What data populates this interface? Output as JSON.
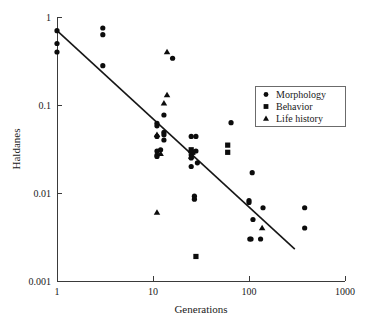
{
  "chart_data": {
    "type": "scatter",
    "title": "",
    "xlabel": "Generations",
    "ylabel": "Haldanes",
    "xscale": "log",
    "yscale": "log",
    "xlim": [
      1,
      1000
    ],
    "ylim": [
      0.001,
      1
    ],
    "xticks": [
      1,
      10,
      100,
      1000
    ],
    "xtick_labels": [
      "1",
      "10",
      "100",
      "1000"
    ],
    "yticks": [
      1,
      0.1,
      0.01,
      0.001
    ],
    "ytick_labels": [
      "1",
      "0.1",
      "0.01",
      "0.001"
    ],
    "grid": false,
    "legend_position": "right",
    "legend": [
      {
        "name": "Morphology",
        "marker": "circle"
      },
      {
        "name": "Behavior",
        "marker": "square"
      },
      {
        "name": "Life history",
        "marker": "triangle"
      }
    ],
    "series": [
      {
        "name": "Morphology",
        "marker": "circle",
        "points": [
          [
            1,
            0.7
          ],
          [
            1,
            0.5
          ],
          [
            1,
            0.4
          ],
          [
            3,
            0.75
          ],
          [
            3,
            0.63
          ],
          [
            3,
            0.28
          ],
          [
            11,
            0.062
          ],
          [
            11,
            0.058
          ],
          [
            11,
            0.044
          ],
          [
            11,
            0.03
          ],
          [
            11,
            0.027
          ],
          [
            11,
            0.026
          ],
          [
            12,
            0.031
          ],
          [
            13,
            0.077
          ],
          [
            13,
            0.049
          ],
          [
            13,
            0.046
          ],
          [
            13,
            0.04
          ],
          [
            16,
            0.34
          ],
          [
            25,
            0.044
          ],
          [
            25,
            0.03
          ],
          [
            25,
            0.027
          ],
          [
            25,
            0.025
          ],
          [
            25,
            0.02
          ],
          [
            28,
            0.044
          ],
          [
            28,
            0.03
          ],
          [
            29,
            0.022
          ],
          [
            27,
            0.0092
          ],
          [
            27,
            0.0085
          ],
          [
            65,
            0.063
          ],
          [
            100,
            0.0082
          ],
          [
            100,
            0.0078
          ],
          [
            102,
            0.003
          ],
          [
            105,
            0.003
          ],
          [
            108,
            0.017
          ],
          [
            110,
            0.005
          ],
          [
            132,
            0.003
          ],
          [
            140,
            0.0068
          ],
          [
            380,
            0.0068
          ],
          [
            380,
            0.004
          ]
        ]
      },
      {
        "name": "Behavior",
        "marker": "square",
        "points": [
          [
            25,
            0.031
          ],
          [
            26,
            0.029
          ],
          [
            60,
            0.035
          ],
          [
            60,
            0.029
          ],
          [
            28,
            0.0019
          ]
        ]
      },
      {
        "name": "Life history",
        "marker": "triangle",
        "points": [
          [
            14,
            0.4
          ],
          [
            14,
            0.13
          ],
          [
            13,
            0.105
          ],
          [
            11,
            0.046
          ],
          [
            12,
            0.028
          ],
          [
            25,
            0.03
          ],
          [
            25,
            0.026
          ],
          [
            11,
            0.006
          ],
          [
            137,
            0.004
          ]
        ]
      }
    ],
    "fit_line": {
      "label": "regression",
      "x_start": 1,
      "y_start": 0.7,
      "x_end": 300,
      "y_end": 0.0023
    }
  },
  "axes_geometry": {
    "left_px": 57,
    "right_px": 345,
    "top_px": 17,
    "bottom_px": 281
  }
}
